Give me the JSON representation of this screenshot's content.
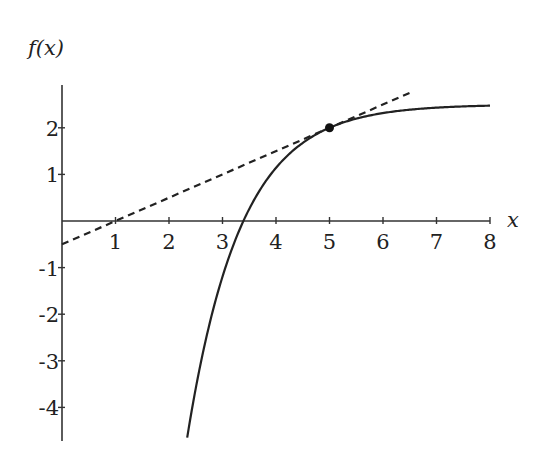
{
  "chart_data": {
    "type": "line",
    "title": "",
    "xlabel": "x",
    "ylabel": "f(x)",
    "xlim": [
      0,
      8
    ],
    "ylim": [
      -4.7,
      2.9
    ],
    "x_ticks": [
      1,
      2,
      3,
      4,
      5,
      6,
      7,
      8
    ],
    "x_tick_labels": [
      "1",
      "2",
      "3",
      "4",
      "5",
      "6",
      "7",
      "8"
    ],
    "y_ticks": [
      -4,
      -3,
      -2,
      -1,
      1,
      2
    ],
    "y_tick_labels": [
      "-4",
      "-3",
      "-2",
      "-1",
      "1",
      "2"
    ],
    "grid": false,
    "legend": null,
    "series": [
      {
        "name": "f(x)",
        "style": "solid",
        "formula": "2.5 - 0.5*exp(-(x-5))",
        "x": [
          2.34,
          2.5,
          2.75,
          3.0,
          3.25,
          3.4,
          3.5,
          3.75,
          4.0,
          4.25,
          4.5,
          4.75,
          5.0,
          5.5,
          6.0,
          6.5,
          7.0,
          7.5,
          8.0
        ],
        "y": [
          -4.65,
          -3.59,
          -2.24,
          -1.19,
          -0.38,
          0.02,
          0.26,
          0.75,
          1.14,
          1.44,
          1.68,
          1.86,
          2.0,
          2.2,
          2.32,
          2.39,
          2.43,
          2.46,
          2.48
        ]
      },
      {
        "name": "tangent line at x=5",
        "style": "dashed",
        "formula": "0.5*x - 0.5",
        "x": [
          0,
          1,
          5,
          6.5
        ],
        "y": [
          -0.5,
          0,
          2,
          2.75
        ]
      }
    ],
    "points": [
      {
        "label": "point of tangency",
        "x": 5,
        "y": 2
      }
    ]
  }
}
